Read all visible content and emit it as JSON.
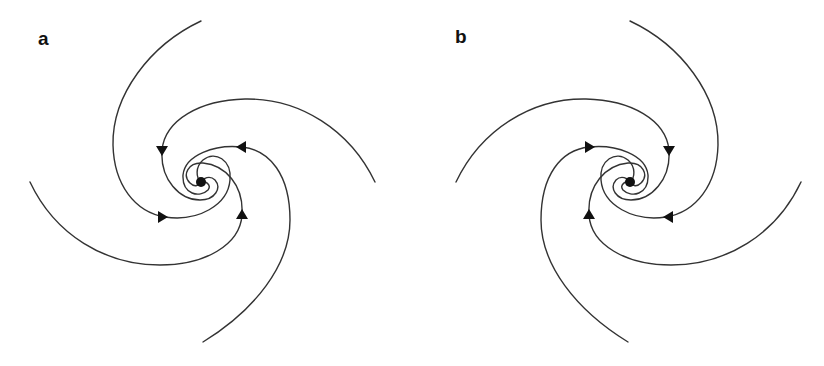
{
  "figure": {
    "type": "phase portrait",
    "line_color": "#333333",
    "arrow_color": "#111111",
    "background": "#ffffff"
  },
  "panels": [
    {
      "label": "a",
      "center": [
        201,
        182
      ],
      "rotation": "clockwise inward",
      "arm_count": 4,
      "arrow_count": 4
    },
    {
      "label": "b",
      "center": [
        630,
        182
      ],
      "rotation": "counter-clockwise inward",
      "arm_count": 4,
      "arrow_count": 4
    }
  ]
}
